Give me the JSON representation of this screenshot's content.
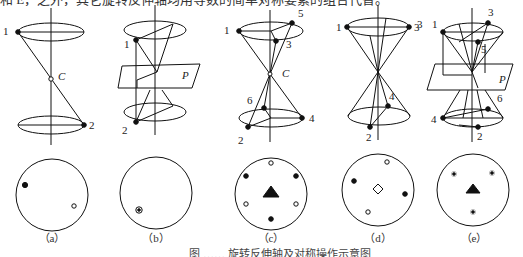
{
  "header_text": "和 E，之外，其它旋转反伸轴均用等数的简单对称要素的组合代替。",
  "figure": {
    "caption": "图 ……  旋转反伸轴及对称操作示意图",
    "panels": [
      {
        "id": "a",
        "label": "（a）",
        "point_labels": [
          "1",
          "2",
          "C"
        ],
        "projection_markers": [
          "filled-dot",
          "open-circle"
        ]
      },
      {
        "id": "b",
        "label": "（b）",
        "point_labels": [
          "1",
          "2",
          "P"
        ],
        "projection_markers": [
          "dot-in-circle"
        ]
      },
      {
        "id": "c",
        "label": "（c）",
        "point_labels": [
          "1",
          "2",
          "3",
          "4",
          "5",
          "6",
          "C"
        ],
        "projection_markers": [
          "filled-triangle",
          "3 filled-dots",
          "3 open-circles"
        ]
      },
      {
        "id": "d",
        "label": "（d）",
        "point_labels": [
          "1",
          "2",
          "3",
          "4"
        ],
        "projection_markers": [
          "open-diamond",
          "2 filled-dots",
          "2 open-circles"
        ]
      },
      {
        "id": "e",
        "label": "（e）",
        "point_labels": [
          "1",
          "2",
          "3",
          "4",
          "5",
          "6",
          "P"
        ],
        "projection_markers": [
          "filled-triangle",
          "3 dot-in-circle"
        ]
      }
    ]
  }
}
